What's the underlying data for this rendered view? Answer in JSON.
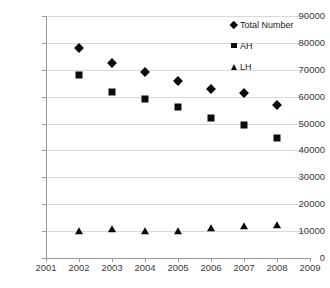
{
  "chart_data": {
    "type": "scatter",
    "title": "",
    "xlabel": "",
    "ylabel": "",
    "x": [
      2002,
      2003,
      2004,
      2005,
      2006,
      2007,
      2008
    ],
    "xlim": [
      2001,
      2009
    ],
    "ylim": [
      0,
      90000
    ],
    "grid": true,
    "legend_position": "top-right",
    "xticks": [
      "2001",
      "2002",
      "2003",
      "2004",
      "2005",
      "2006",
      "2007",
      "2008",
      "2009"
    ],
    "yticks": [
      "0",
      "10000",
      "20000",
      "30000",
      "40000",
      "50000",
      "60000",
      "70000",
      "80000",
      "90000"
    ],
    "series": [
      {
        "name": "Total Number",
        "marker": "diamond",
        "color": "#0a0a0a",
        "values": [
          78000,
          72500,
          69000,
          66000,
          63000,
          61200,
          57000
        ]
      },
      {
        "name": "AH",
        "marker": "square",
        "color": "#0a0a0a",
        "values": [
          68000,
          61800,
          59000,
          56100,
          52200,
          49500,
          44800
        ]
      },
      {
        "name": "LH",
        "marker": "triangle",
        "color": "#0a0a0a",
        "values": [
          10100,
          10700,
          10100,
          10000,
          11000,
          11900,
          12400
        ]
      }
    ]
  },
  "axis_colors": {
    "gridline": "#d9d9d9",
    "axis": "#9a9a9a",
    "tick_text": "#3a3a3a"
  }
}
